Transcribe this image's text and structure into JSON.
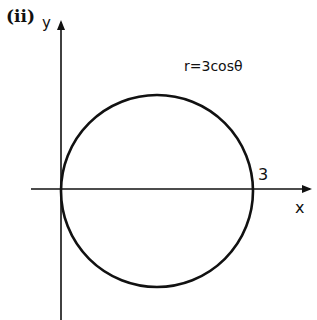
{
  "figure": {
    "part_label": "(ii)",
    "y_axis_label": "y",
    "x_axis_label": "x",
    "curve_equation": "r=3cosθ",
    "intercept_label": "3",
    "colors": {
      "stroke": "#111111",
      "background": "#ffffff"
    }
  },
  "geometry": {
    "axes_origin": [
      61,
      189
    ],
    "circle_center": [
      157,
      191
    ],
    "circle_radius": 96,
    "x_axis_span": [
      31,
      312
    ],
    "y_axis_span": [
      20,
      320
    ]
  }
}
